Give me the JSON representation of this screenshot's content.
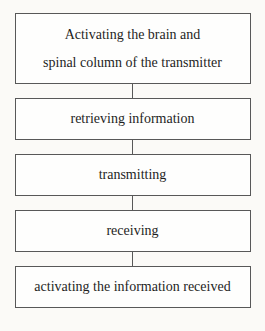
{
  "diagram": {
    "type": "flowchart",
    "direction": "top-to-bottom",
    "colors": {
      "background": "#fbfaf7",
      "box_fill": "#fefefd",
      "box_border": "#585858",
      "text": "#1e1e1e"
    },
    "boxes": [
      {
        "id": "activating-transmitter",
        "lines": [
          "Activating the brain and",
          "spinal column of the transmitter"
        ]
      },
      {
        "id": "retrieving-information",
        "lines": [
          "retrieving information"
        ]
      },
      {
        "id": "transmitting",
        "lines": [
          "transmitting"
        ]
      },
      {
        "id": "receiving",
        "lines": [
          "receiving"
        ]
      },
      {
        "id": "activating-information-received",
        "lines": [
          "activating the information received"
        ]
      }
    ],
    "connections": [
      {
        "from": "activating-transmitter",
        "to": "retrieving-information"
      },
      {
        "from": "retrieving-information",
        "to": "transmitting"
      },
      {
        "from": "transmitting",
        "to": "receiving"
      },
      {
        "from": "receiving",
        "to": "activating-information-received"
      }
    ]
  }
}
